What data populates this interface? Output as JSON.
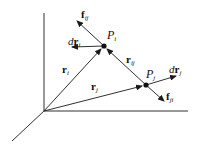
{
  "diagram": {
    "points": [
      {
        "id": "Pi",
        "label": "P",
        "sub": "i",
        "x": 104,
        "y": 46
      },
      {
        "id": "Pj",
        "label": "P",
        "sub": "j",
        "x": 146,
        "y": 85
      }
    ],
    "vectors": [
      {
        "id": "r_i",
        "label": "r",
        "sub": "i"
      },
      {
        "id": "r_j",
        "label": "r",
        "sub": "j"
      },
      {
        "id": "r_ij",
        "label": "r",
        "sub": "ij"
      },
      {
        "id": "f_ij",
        "label": "f",
        "sub": "ij"
      },
      {
        "id": "f_ji",
        "label": "f",
        "sub": "ji"
      },
      {
        "id": "dr_i",
        "prefix": "d",
        "label": "r",
        "sub": "i"
      },
      {
        "id": "dr_j",
        "prefix": "d",
        "label": "r",
        "sub": "j"
      }
    ],
    "colors": {
      "stroke": "#1a1a1a",
      "background": "#ffffff"
    }
  }
}
